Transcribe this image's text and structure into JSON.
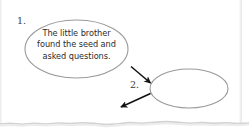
{
  "worksheet": {
    "width": 249,
    "height": 134,
    "background_color": "#ffffff",
    "paper_edge_color": "#d9d9d9"
  },
  "diagram": {
    "type": "sequence-flow",
    "stroke_color": "#999999",
    "arrow_color": "#111111",
    "steps": [
      {
        "number_label": "1.",
        "shape": "ellipse",
        "filled": false,
        "text_lines": [
          "The little brother",
          "found the seed and",
          "asked questions."
        ],
        "text": "The little brother found the seed and asked questions."
      },
      {
        "number_label": "2.",
        "shape": "ellipse",
        "filled": false,
        "text_lines": [],
        "text": ""
      }
    ],
    "arrows": [
      {
        "name": "arrow-step1-to-step2",
        "direction": "down-right"
      },
      {
        "name": "arrow-step2-to-step3",
        "direction": "down-left"
      }
    ]
  }
}
